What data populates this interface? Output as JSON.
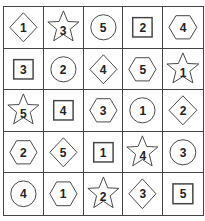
{
  "puzzle": {
    "rows": [
      [
        {
          "shape": "diamond",
          "number": "1"
        },
        {
          "shape": "star",
          "number": "3"
        },
        {
          "shape": "circle",
          "number": "5"
        },
        {
          "shape": "square",
          "number": "2"
        },
        {
          "shape": "hexagon",
          "number": "4"
        }
      ],
      [
        {
          "shape": "square",
          "number": "3"
        },
        {
          "shape": "circle",
          "number": "2"
        },
        {
          "shape": "diamond",
          "number": "4"
        },
        {
          "shape": "hexagon",
          "number": "5"
        },
        {
          "shape": "star",
          "number": "1"
        }
      ],
      [
        {
          "shape": "star",
          "number": "5"
        },
        {
          "shape": "square",
          "number": "4"
        },
        {
          "shape": "hexagon",
          "number": "3"
        },
        {
          "shape": "circle",
          "number": "1"
        },
        {
          "shape": "diamond",
          "number": "2"
        }
      ],
      [
        {
          "shape": "hexagon",
          "number": "2"
        },
        {
          "shape": "diamond",
          "number": "5"
        },
        {
          "shape": "square",
          "number": "1"
        },
        {
          "shape": "star",
          "number": "4"
        },
        {
          "shape": "circle",
          "number": "3"
        }
      ],
      [
        {
          "shape": "circle",
          "number": "4"
        },
        {
          "shape": "hexagon",
          "number": "1"
        },
        {
          "shape": "star",
          "number": "2"
        },
        {
          "shape": "diamond",
          "number": "3"
        },
        {
          "shape": "square",
          "number": "5"
        }
      ]
    ],
    "colors": {
      "line": "#444444",
      "text": "#222222",
      "background": "#ffffff"
    }
  }
}
